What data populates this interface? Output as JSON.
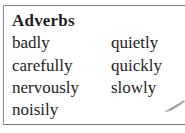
{
  "box": {
    "title": "Adverbs",
    "columns": [
      [
        "badly",
        "carefully",
        "nervously",
        "noisily"
      ],
      [
        "quietly",
        "quickly",
        "slowly"
      ]
    ]
  },
  "decoration": "pencil-stroke-icon",
  "colors": {
    "text": "#1e1e1e",
    "border": "#8a8a8a"
  }
}
